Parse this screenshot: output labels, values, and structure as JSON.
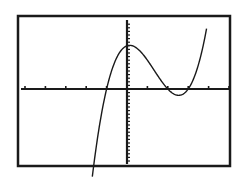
{
  "chart_data": {
    "type": "line",
    "title": "",
    "xlabel": "",
    "ylabel": "",
    "function": "y = 2(x+1)(x-2)(x-3)",
    "xlim": [
      -5,
      5
    ],
    "ylim": [
      -22,
      19
    ],
    "xscl": 1,
    "yscl": 1,
    "grid": false,
    "roots": [
      -1,
      2,
      3
    ],
    "y_intercept": 12,
    "local_max": {
      "x": -0.1,
      "y": 12.1
    },
    "local_min": {
      "x": 2.5,
      "y": -1.0
    },
    "series": [
      {
        "name": "Y1",
        "x": [
          -1.7,
          -1.5,
          -1,
          -0.5,
          0,
          0.5,
          1,
          1.5,
          2,
          2.5,
          3,
          3.5,
          3.9
        ],
        "y": [
          -19.6,
          -15.75,
          0,
          8.75,
          12,
          11.25,
          8,
          3.75,
          0,
          -1.75,
          0,
          6.75,
          16.7
        ]
      }
    ]
  },
  "frame": {
    "x": 18,
    "y": 16,
    "w": 212,
    "h": 150
  },
  "origin_px": {
    "x": 127,
    "y": 89
  },
  "px_per_unit": {
    "x": 20.4,
    "y": 3.6
  },
  "colors": {
    "ink": "#1a1a1a",
    "background": "#ffffff"
  }
}
